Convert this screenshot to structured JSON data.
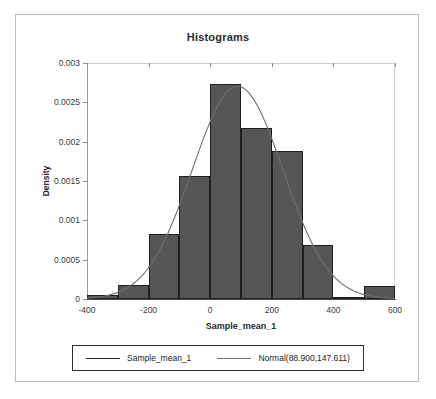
{
  "chart_data": {
    "type": "bar",
    "title": "Histograms",
    "xlabel": "Sample_mean_1",
    "ylabel": "Density",
    "xlim": [
      -400,
      600
    ],
    "ylim": [
      0,
      0.003
    ],
    "grid": false,
    "bin_width": 100,
    "bin_edges": [
      -400,
      -300,
      -200,
      -100,
      0,
      100,
      200,
      300,
      400,
      500,
      600
    ],
    "categories": [
      "-400 to -300",
      "-300 to -200",
      "-200 to -100",
      "-100 to 0",
      "0 to 100",
      "100 to 200",
      "200 to 300",
      "300 to 400",
      "400 to 500",
      "500 to 600"
    ],
    "values": [
      5e-05,
      0.00018,
      0.00083,
      0.00157,
      0.00273,
      0.00218,
      0.00188,
      0.00069,
      3e-05,
      0.00016
    ],
    "xticks": [
      -400,
      -200,
      0,
      200,
      400,
      600
    ],
    "xticklabels": [
      "-400",
      "-200",
      "0",
      "200",
      "400",
      "600"
    ],
    "yticks": [
      0,
      0.0005,
      0.001,
      0.0015,
      0.002,
      0.0025,
      0.003
    ],
    "yticklabels": [
      "0",
      "0.0005",
      "0.001",
      "0.0015",
      "0.002",
      "0.0025",
      "0.003"
    ],
    "overlay": {
      "type": "line",
      "name": "Normal(88.900,147.611)",
      "distribution": "normal",
      "mean": 88.9,
      "stdev": 147.611,
      "scale": 1
    },
    "legend": {
      "position": "bottom",
      "entries": [
        {
          "label": "Sample_mean_1",
          "marker": "line",
          "color": "#232323"
        },
        {
          "label": "Normal(88.900,147.611)",
          "marker": "line",
          "color": "#6e6e6e"
        }
      ]
    },
    "colors": {
      "bar_fill": "#565656",
      "bar_edge": "#1f1f1f",
      "curve": "#6e6e6e",
      "axis": "#4a4a4a",
      "text": "#2b2b2b",
      "frame": "#b9b9b9"
    }
  }
}
